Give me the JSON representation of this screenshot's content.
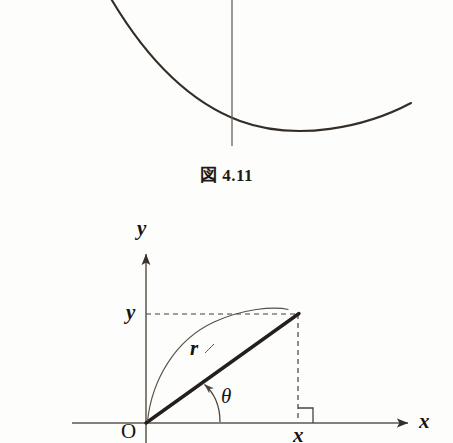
{
  "page": {
    "background_color": "#fdfdfb",
    "ink_color": "#2b2620",
    "width": 453,
    "height": 443
  },
  "figure_top": {
    "name": "catenary-curve-fragment",
    "description": "Bottom portion of a U-shaped (catenary) curve crossed by a vertical axis line",
    "curve_color": "#332d26",
    "axis_color": "#6a6257",
    "curve_path": "M 110 -2 C 150 62 196 108 246 124 C 300 141 366 126 411 103",
    "vertical_line": {
      "x": 232,
      "y_top": -2,
      "y_bottom": 146
    }
  },
  "caption": {
    "text": "図 4.11"
  },
  "figure_bottom": {
    "name": "polar-coordinate-diagram",
    "title_implied": "polar coordinates r, theta with rectangular x, y",
    "axes": {
      "x_axis": {
        "x_start": 72,
        "x_end": 412,
        "y": 423,
        "arrow": true,
        "label": "x"
      },
      "y_axis": {
        "x": 146,
        "y_top": 250,
        "y_bottom": 443,
        "arrow": true,
        "label": "y"
      }
    },
    "origin": {
      "label": "O",
      "x": 146,
      "y": 423
    },
    "point": {
      "x": 298,
      "y": 314
    },
    "labels": {
      "y_axis": "y",
      "x_axis": "x",
      "y_value": "y",
      "x_value": "x",
      "origin": "O",
      "radius": "r",
      "angle": "θ"
    },
    "dashed_lines": {
      "horizontal": {
        "from_x": 146,
        "to_x": 298,
        "y": 314
      },
      "vertical": {
        "x": 298,
        "from_y": 314,
        "to_y": 423
      }
    },
    "right_angle_marker": {
      "corner_x": 313,
      "corner_y": 423,
      "size": 15
    },
    "radius_vector": {
      "from": [
        146,
        423
      ],
      "to": [
        299,
        314
      ],
      "stroke_width": 3.2
    },
    "angle_arc": {
      "radius": 74,
      "from_deg": 0,
      "to_deg": 35
    },
    "radius_arc_annotation": {
      "start": [
        147,
        422
      ],
      "end": [
        288,
        309
      ]
    }
  }
}
